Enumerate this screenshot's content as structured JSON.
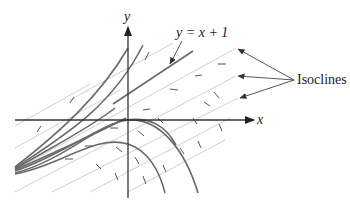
{
  "figure": {
    "type": "direction-field-with-isoclines",
    "axes": {
      "x_label": "x",
      "y_label": "y"
    },
    "labels": {
      "special_line": "y = x + 1",
      "isoclines": "Isoclines"
    },
    "colors": {
      "axis": "#333333",
      "solution_curves": "#6a6a6a",
      "isoclines": "#cfcfcf",
      "slope_marks": "#555555",
      "background": "#ffffff"
    },
    "isocline_count_labeled": 3,
    "solution_curve_count": 9
  }
}
